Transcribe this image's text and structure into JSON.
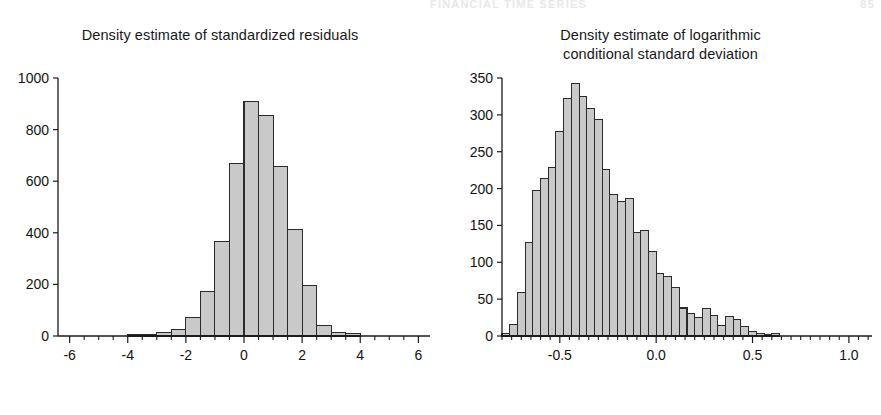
{
  "page": {
    "header_text": "FINANCIAL TIME SERIES",
    "folio": "85",
    "background_color": "#ffffff",
    "bar_fill_color": "#c9c9c9",
    "bar_stroke_color": "#2b2b2b",
    "axis_color": "#1a1a1a"
  },
  "chart_data": [
    {
      "id": "left",
      "type": "bar",
      "title": "Density estimate of standardized residuals",
      "title_lines": [
        "Density estimate of standardized residuals"
      ],
      "xlabel": "",
      "ylabel": "",
      "xlim": [
        -6.4,
        6.4
      ],
      "ylim": [
        0,
        1000
      ],
      "grid": false,
      "legend": null,
      "bin_width": 0.5,
      "x_ticks_major": [
        -6,
        -4,
        -2,
        0,
        2,
        4,
        6
      ],
      "x_tick_labels": [
        "-6",
        "-4",
        "-2",
        "0",
        "2",
        "4",
        "6"
      ],
      "x_tick_minor_step": 0.5,
      "y_ticks": [
        0,
        200,
        400,
        600,
        800,
        1000
      ],
      "y_tick_labels": [
        "0",
        "200",
        "400",
        "600",
        "800",
        "1000"
      ],
      "bin_edges": [
        -4.0,
        -3.5,
        -3.0,
        -2.5,
        -2.0,
        -1.5,
        -1.0,
        -0.5,
        0.0,
        0.5,
        1.0,
        1.5,
        2.0,
        2.5,
        3.0,
        3.5
      ],
      "categories": [
        "-4.0",
        "-3.5",
        "-3.0",
        "-2.5",
        "-2.0",
        "-1.5",
        "-1.0",
        "-0.5",
        "0.0",
        "0.5",
        "1.0",
        "1.5",
        "2.0",
        "2.5",
        "3.0"
      ],
      "values": [
        4,
        6,
        12,
        26,
        70,
        172,
        366,
        670,
        910,
        855,
        658,
        412,
        196,
        42,
        14,
        10
      ]
    },
    {
      "id": "right",
      "type": "bar",
      "title": "Density estimate of logarithmic conditional standard deviation",
      "title_lines": [
        "Density estimate of logarithmic",
        "conditional standard deviation"
      ],
      "xlabel": "",
      "ylabel": "",
      "xlim": [
        -0.8,
        1.12
      ],
      "ylim": [
        0,
        350
      ],
      "grid": false,
      "legend": null,
      "bin_width": 0.04,
      "x_ticks_major": [
        -0.5,
        0.0,
        0.5,
        1.0
      ],
      "x_tick_labels": [
        "-0.5",
        "0.0",
        "0.5",
        "1.0"
      ],
      "x_tick_minor_step": 0.05,
      "y_ticks": [
        0,
        50,
        100,
        150,
        200,
        250,
        300,
        350
      ],
      "y_tick_labels": [
        "0",
        "50",
        "100",
        "150",
        "200",
        "250",
        "300",
        "350"
      ],
      "bin_start": -0.8,
      "categories": [
        "-0.80",
        "-0.76",
        "-0.72",
        "-0.68",
        "-0.64",
        "-0.60",
        "-0.56",
        "-0.52",
        "-0.48",
        "-0.44",
        "-0.40",
        "-0.36",
        "-0.32",
        "-0.28",
        "-0.24",
        "-0.20",
        "-0.16",
        "-0.12",
        "-0.08",
        "-0.04",
        "0.00",
        "0.04",
        "0.08",
        "0.12",
        "0.16",
        "0.20",
        "0.24",
        "0.28",
        "0.32",
        "0.36",
        "0.40",
        "0.44",
        "0.48",
        "0.52",
        "0.56",
        "0.60",
        "0.64",
        "0.68",
        "0.72",
        "0.76",
        "0.80",
        "0.84",
        "0.88",
        "0.92",
        "0.96",
        "1.00",
        "1.04",
        "1.08"
      ],
      "values": [
        3,
        15,
        59,
        127,
        197,
        214,
        228,
        277,
        322,
        342,
        325,
        308,
        294,
        226,
        192,
        183,
        186,
        140,
        143,
        115,
        85,
        81,
        66,
        38,
        31,
        25,
        37,
        28,
        14,
        27,
        22,
        13,
        6,
        3,
        2,
        4
      ]
    }
  ]
}
